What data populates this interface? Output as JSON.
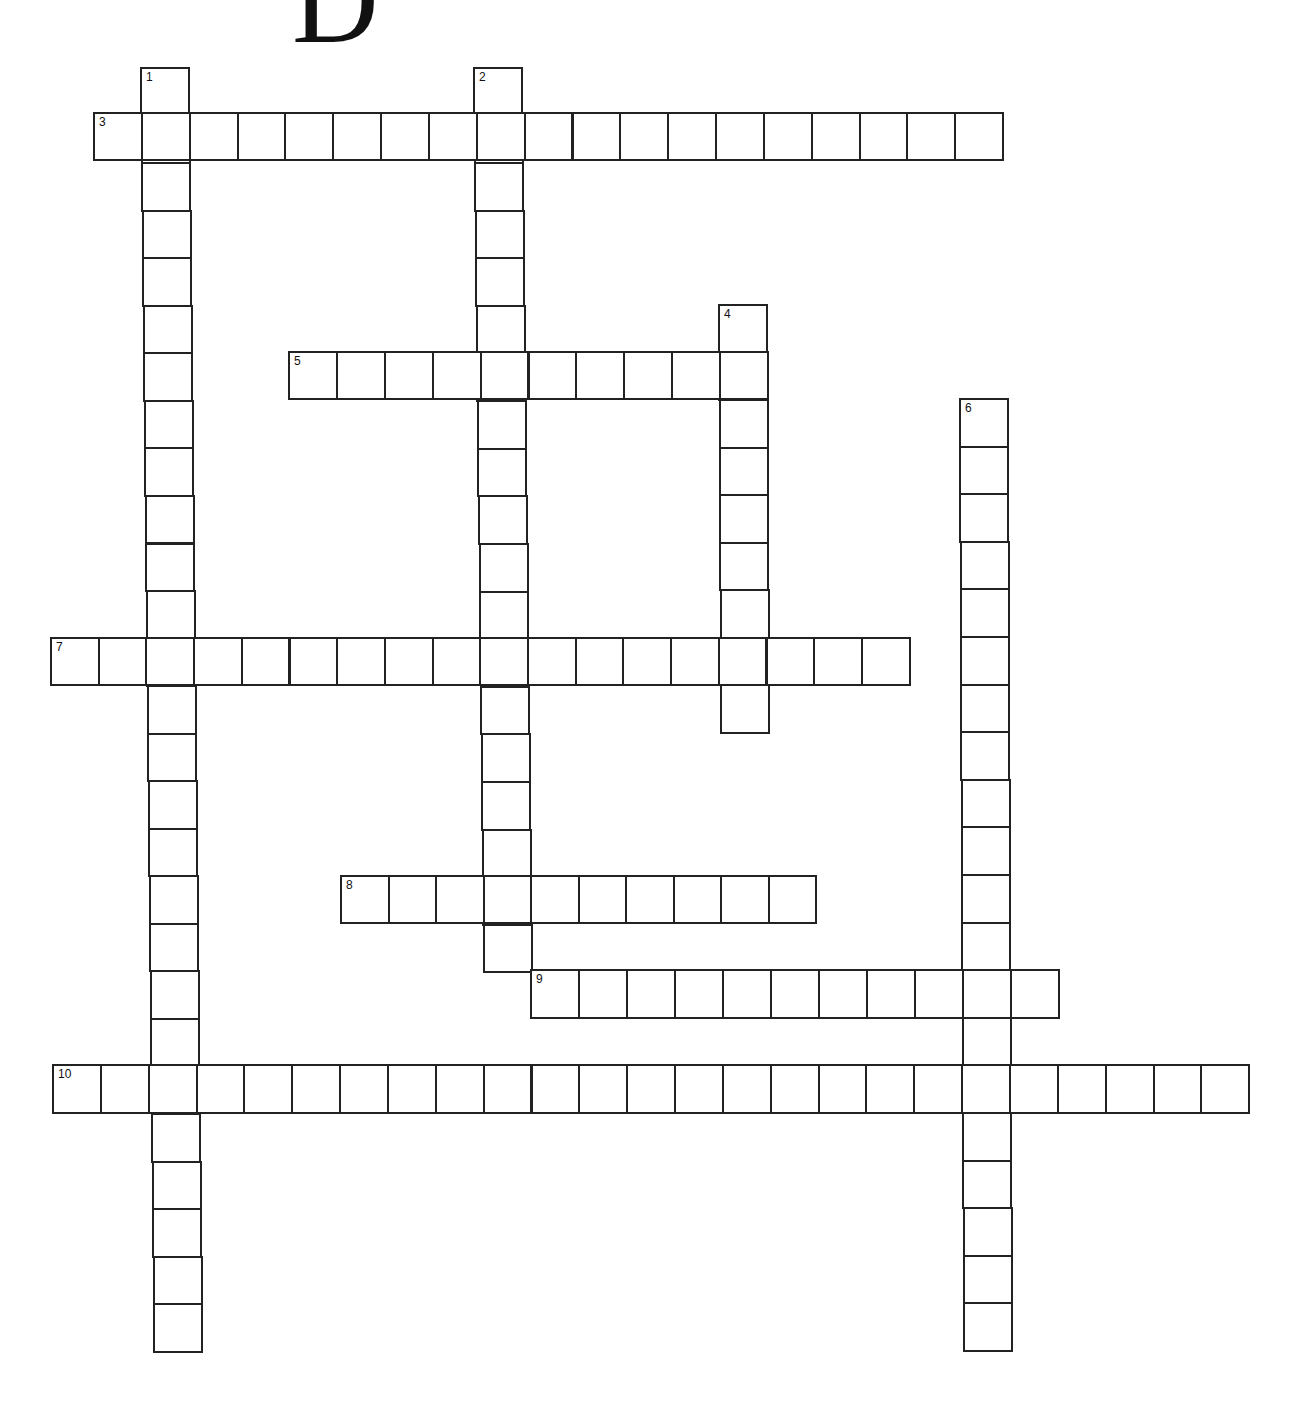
{
  "puzzle": {
    "title_letter": "D",
    "type": "crossword",
    "ink_color": "#222222",
    "background_color": "#ffffff",
    "entries": [
      {
        "number": "1",
        "direction": "down",
        "length": 27,
        "x": 140,
        "y": 67,
        "x_end": 153,
        "cell_w": 48,
        "cell_h": 47.55
      },
      {
        "number": "2",
        "direction": "down",
        "length": 19,
        "x": 473,
        "y": 67,
        "x_end": 483,
        "cell_w": 48,
        "cell_h": 47.6
      },
      {
        "number": "3",
        "direction": "across",
        "length": 19,
        "x": 93,
        "y": 112,
        "cell_w": 47.85,
        "cell_h": 47
      },
      {
        "number": "4",
        "direction": "down",
        "length": 9,
        "x": 718,
        "y": 304,
        "x_end": 720,
        "cell_w": 48,
        "cell_h": 47.5
      },
      {
        "number": "5",
        "direction": "across",
        "length": 10,
        "x": 288,
        "y": 351,
        "cell_w": 47.9,
        "cell_h": 47
      },
      {
        "number": "6",
        "direction": "down",
        "length": 20,
        "x": 959,
        "y": 398,
        "x_end": 963,
        "cell_w": 48,
        "cell_h": 47.6
      },
      {
        "number": "7",
        "direction": "across",
        "length": 18,
        "x": 50,
        "y": 637,
        "cell_w": 47.7,
        "cell_h": 47
      },
      {
        "number": "8",
        "direction": "across",
        "length": 10,
        "x": 340,
        "y": 875,
        "cell_w": 47.5,
        "cell_h": 47
      },
      {
        "number": "9",
        "direction": "across",
        "length": 11,
        "x": 530,
        "y": 969,
        "cell_w": 48,
        "cell_h": 48
      },
      {
        "number": "10",
        "direction": "across",
        "length": 25,
        "x": 52,
        "y": 1064,
        "cell_w": 47.85,
        "cell_h": 48
      }
    ]
  }
}
